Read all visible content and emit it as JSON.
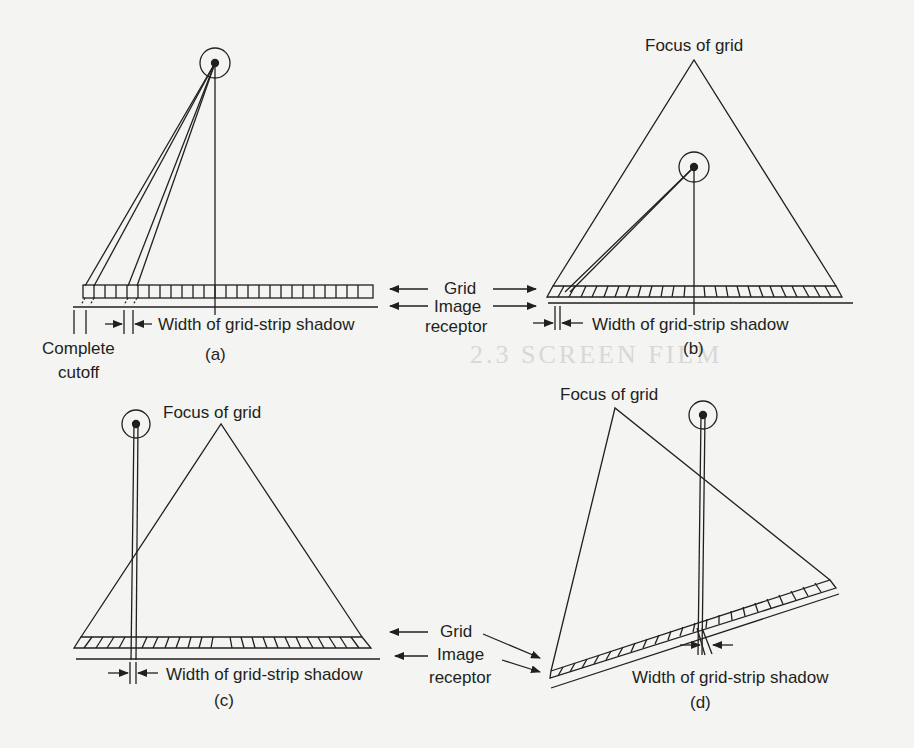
{
  "figure": {
    "panels": [
      {
        "id": "a",
        "caption": "(a)",
        "shadow_label": "Width of grid-strip shadow",
        "extra_label_line1": "Complete",
        "extra_label_line2": "cutoff"
      },
      {
        "id": "b",
        "caption": "(b)",
        "focus_label": "Focus of grid",
        "shadow_label": "Width of grid-strip shadow"
      },
      {
        "id": "c",
        "caption": "(c)",
        "focus_label": "Focus of grid",
        "shadow_label": "Width of grid-strip shadow"
      },
      {
        "id": "d",
        "caption": "(d)",
        "focus_label": "Focus of grid",
        "shadow_label": "Width of grid-strip shadow"
      }
    ],
    "shared_labels_top": {
      "grid": "Grid",
      "image_line1": "Image",
      "image_line2": "receptor"
    },
    "shared_labels_bottom": {
      "grid": "Grid",
      "image_line1": "Image",
      "image_line2": "receptor"
    },
    "colors": {
      "ink": "#231f20",
      "paper": "#f4f4f2"
    }
  },
  "bleed_through": [
    "2.3  SCREEN FILM"
  ]
}
